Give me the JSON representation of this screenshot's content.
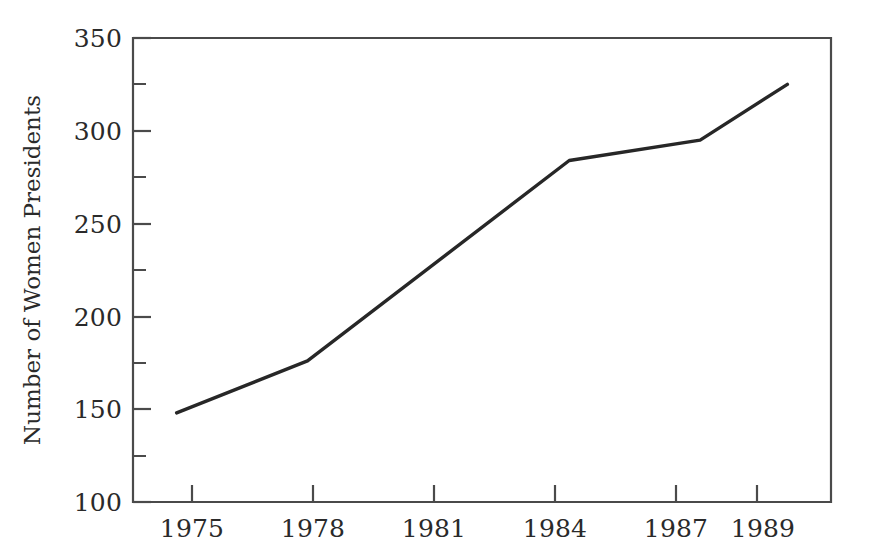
{
  "chart_data": {
    "type": "line",
    "title": "",
    "xlabel": "",
    "ylabel": "Number of Women Presidents",
    "x": [
      1975,
      1978,
      1984,
      1987,
      1989
    ],
    "values": [
      148,
      176,
      284,
      295,
      325
    ],
    "series": [
      {
        "name": "Number of Women Presidents",
        "values": [
          148,
          176,
          284,
          295,
          325
        ]
      }
    ],
    "xlim": [
      1974,
      1990
    ],
    "ylim": [
      100,
      350
    ],
    "x_tick_labels": [
      "1975",
      "1978",
      "1981",
      "1984",
      "1987",
      "1989"
    ],
    "x_tick_values": [
      1975,
      1978,
      1981,
      1984,
      1987,
      1989
    ],
    "y_tick_labels": [
      "100",
      "150",
      "200",
      "250",
      "300",
      "350"
    ],
    "y_tick_values": [
      100,
      150,
      200,
      250,
      300,
      350
    ],
    "y_minor_tick_values": [
      125,
      175,
      225,
      275,
      325
    ],
    "grid": false,
    "legend": false,
    "legend_position": "none",
    "line_color": "#272727",
    "frame_color": "#4a4a4a",
    "background_color": "#ffffff"
  },
  "axis": {
    "y_title": "Number of Women Presidents",
    "x_title": "",
    "y_ticks": [
      {
        "label": "350",
        "value": 350
      },
      {
        "label": "300",
        "value": 300
      },
      {
        "label": "250",
        "value": 250
      },
      {
        "label": "200",
        "value": 200
      },
      {
        "label": "150",
        "value": 150
      },
      {
        "label": "100",
        "value": 100
      }
    ],
    "x_ticks": [
      {
        "label": "1975",
        "value": 1975
      },
      {
        "label": "1978",
        "value": 1978
      },
      {
        "label": "1981",
        "value": 1981
      },
      {
        "label": "1984",
        "value": 1984
      },
      {
        "label": "1987",
        "value": 1987
      },
      {
        "label": "1989",
        "value": 1989
      }
    ]
  }
}
